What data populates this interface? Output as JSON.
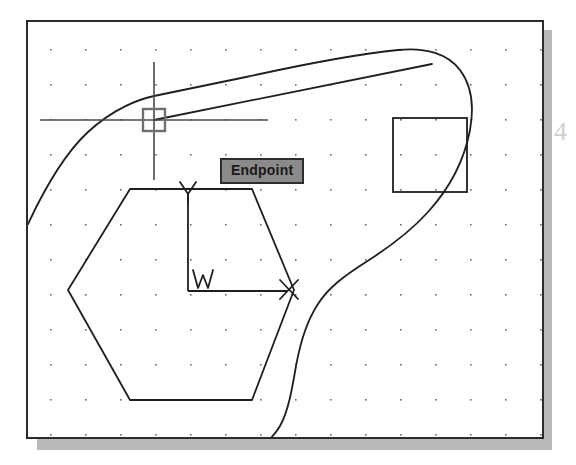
{
  "page": {
    "background_color": "#ffffff",
    "margin_text": "4"
  },
  "cad_window": {
    "name": "drawing-area",
    "background_color": "#ffffff",
    "border_color": "#2b2b2b",
    "shadow_color": "#b9b9b9",
    "grid": {
      "type": "dot-grid",
      "dot_color": "#6b6b6b",
      "spacing_x": 35,
      "spacing_y": 35,
      "origin_x": 22,
      "origin_y": 27
    },
    "geometry_color": "#1f1f1f"
  },
  "tooltip": {
    "label": "Endpoint",
    "background_color": "#8a8a8a",
    "border_color": "#2d2d2d",
    "text_color": "#1a1a1a"
  },
  "cursor": {
    "name": "crosshair-cursor",
    "center_x": 152,
    "center_y": 118,
    "snap_marker": "square",
    "snap_marker_size": 22
  },
  "ucs_icon": {
    "origin_label": "W",
    "x_axis_label": "X",
    "y_axis_label": "Y"
  },
  "entities": [
    {
      "name": "spline",
      "type": "spline"
    },
    {
      "name": "line",
      "type": "line"
    },
    {
      "name": "hexagon",
      "type": "polygon",
      "sides": 6
    },
    {
      "name": "rectangle",
      "type": "rectangle"
    }
  ]
}
